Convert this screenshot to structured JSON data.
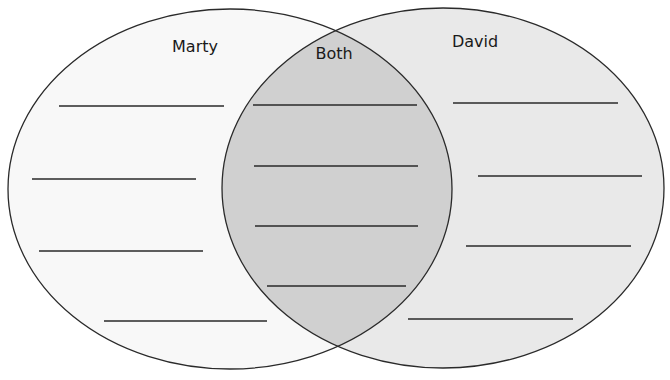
{
  "diagram": {
    "type": "venn",
    "colors": {
      "left_fill": "#f8f8f8",
      "right_fill": "#e9e9e9",
      "overlap_fill": "#d0d0d0",
      "stroke": "#2a2a2a",
      "background": "#ffffff"
    },
    "sets": [
      {
        "id": "left",
        "label": "Marty",
        "ellipse": {
          "cx": 230,
          "cy": 189,
          "rx": 222,
          "ry": 180
        },
        "label_pos": {
          "x": 195,
          "y": 52
        },
        "blank_lines": [
          {
            "x1": 59,
            "x2": 224,
            "y": 106
          },
          {
            "x1": 32,
            "x2": 196,
            "y": 179
          },
          {
            "x1": 39,
            "x2": 203,
            "y": 251
          },
          {
            "x1": 104,
            "x2": 267,
            "y": 321
          }
        ]
      },
      {
        "id": "right",
        "label": "David",
        "ellipse": {
          "cx": 443,
          "cy": 188,
          "rx": 221,
          "ry": 180
        },
        "label_pos": {
          "x": 475,
          "y": 47
        },
        "blank_lines": [
          {
            "x1": 453,
            "x2": 618,
            "y": 103
          },
          {
            "x1": 478,
            "x2": 642,
            "y": 176
          },
          {
            "x1": 466,
            "x2": 631,
            "y": 246
          },
          {
            "x1": 408,
            "x2": 573,
            "y": 319
          }
        ]
      }
    ],
    "overlap": {
      "label": "Both",
      "label_pos": {
        "x": 334,
        "y": 59
      },
      "blank_lines": [
        {
          "x1": 253,
          "x2": 417,
          "y": 105
        },
        {
          "x1": 254,
          "x2": 418,
          "y": 166
        },
        {
          "x1": 255,
          "x2": 418,
          "y": 226
        },
        {
          "x1": 267,
          "x2": 406,
          "y": 286
        }
      ]
    }
  }
}
